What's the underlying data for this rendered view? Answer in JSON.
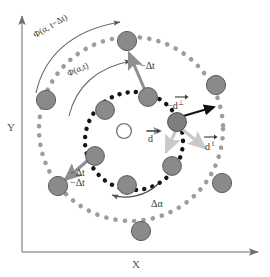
{
  "figure": {
    "type": "physics-schematic"
  },
  "axes": {
    "x_label": "X",
    "y_label": "Y",
    "x_axis_name": "x-axis-arrow",
    "y_axis_name": "y-axis-arrow"
  },
  "labels": {
    "phi_prev": "Φ(α, t−Δt)",
    "phi_now": "Φ(α,t)",
    "delta_alpha": "Δα",
    "minus_dt_top": "−Δt",
    "minus_dt_left_1": "−Δt",
    "minus_dt_left_2": "−Δt",
    "d_center": "d",
    "d_perp": "−d",
    "d_perp_sup": "⊥",
    "d_tan": "d",
    "d_tan_sup": "t"
  },
  "colors": {
    "particle_fill": "#8a8a8a",
    "particle_stroke": "#5c5c5c",
    "outer_ring_dots": "#9a9a9a",
    "inner_ring_dots": "#1a1a1a",
    "arrow_gray": "#8f8f8f",
    "arrow_light": "#c9c9c9",
    "arrow_black": "#111111",
    "axis": "#8d8d8d",
    "text": "#3a3a3a",
    "center_circle_fill": "#ffffff"
  },
  "geometry": {
    "center_x": 131,
    "center_y": 129,
    "outer_radius": 92,
    "inner_radius": 49,
    "particle_radius": 9.5
  },
  "outer_particles": [
    {
      "name": "outer-particle-top",
      "x": 127,
      "y": 41
    },
    {
      "name": "outer-particle-upper-right",
      "x": 216,
      "y": 85
    },
    {
      "name": "outer-particle-right",
      "x": 222,
      "y": 183
    },
    {
      "name": "outer-particle-bottom",
      "x": 141,
      "y": 231
    },
    {
      "name": "outer-particle-lower-left",
      "x": 58,
      "y": 186
    },
    {
      "name": "outer-particle-left",
      "x": 46,
      "y": 100
    }
  ],
  "inner_particles": [
    {
      "name": "inner-particle-top",
      "x": 148,
      "y": 97
    },
    {
      "name": "inner-particle-key",
      "x": 177,
      "y": 122
    },
    {
      "name": "inner-particle-lower-right",
      "x": 172,
      "y": 166
    },
    {
      "name": "inner-particle-bottom",
      "x": 127,
      "y": 185
    },
    {
      "name": "inner-particle-lower-left",
      "x": 95,
      "y": 156
    },
    {
      "name": "inner-particle-left",
      "x": 105,
      "y": 110
    }
  ],
  "vectors": [
    {
      "name": "vector-minus-dt-top",
      "label": "−Δt",
      "color": "gray"
    },
    {
      "name": "vector-minus-dt-left",
      "label": "−Δt",
      "color": "gray"
    },
    {
      "name": "vector-d-perp",
      "label": "−d⊥",
      "color": "black"
    },
    {
      "name": "vector-d-tangential",
      "label": "d t",
      "color": "light"
    },
    {
      "name": "vector-d-center",
      "label": "d",
      "color": "gray"
    },
    {
      "name": "vector-d-down",
      "label": "",
      "color": "light"
    }
  ]
}
